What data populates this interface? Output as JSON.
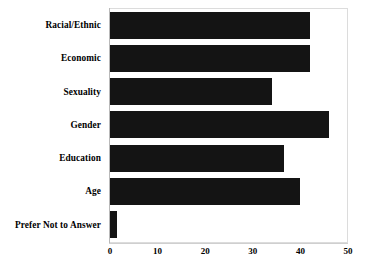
{
  "chart_data": {
    "type": "bar",
    "orientation": "horizontal",
    "title": "",
    "subtitle": "",
    "xlabel": "",
    "ylabel": "",
    "xlim": [
      0,
      50
    ],
    "xticks": [
      0,
      10,
      20,
      30,
      40,
      50
    ],
    "xtick_labels": [
      "0",
      "10",
      "20",
      "30",
      "40",
      "50"
    ],
    "grid": false,
    "legend": null,
    "bar_color": "#141414",
    "background_color": "#ffffff",
    "frame_color": "#dcdcdc",
    "categories": [
      "Racial/Ethnic",
      "Economic",
      "Sexuality",
      "Gender",
      "Education",
      "Age",
      "Prefer Not to Answer"
    ],
    "values": [
      42,
      42,
      34,
      46,
      36.5,
      40,
      1.5
    ],
    "annotations": []
  }
}
